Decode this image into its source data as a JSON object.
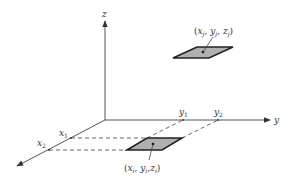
{
  "diagram": {
    "axes": {
      "x_label": "x",
      "y_label": "y",
      "z_label": "z"
    },
    "ticks": {
      "x1": "x",
      "x1_sub": "1",
      "x2": "x",
      "x2_sub": "2",
      "y1": "y",
      "y1_sub": "1",
      "y2": "y",
      "y2_sub": "2"
    },
    "points": {
      "top": {
        "label": "(x_j, y_j, z_j)",
        "x": "x",
        "y": "y",
        "z": "z",
        "sub": "j"
      },
      "bottom": {
        "label": "(x_i, y_i, z_i)",
        "x": "x",
        "y": "y",
        "z": "z",
        "sub": "i"
      }
    },
    "colors": {
      "line": "#333333",
      "plane_fill": "#b0b0b0",
      "plane_stroke": "#222222"
    }
  }
}
